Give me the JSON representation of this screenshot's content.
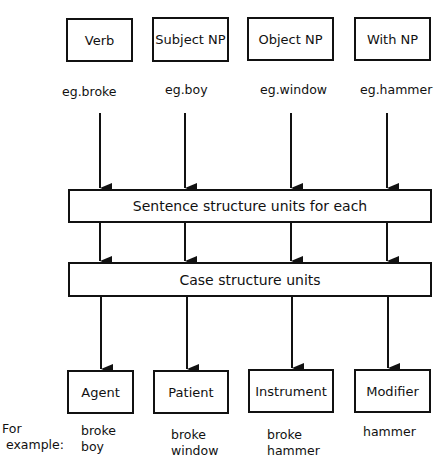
{
  "diagram": {
    "top_boxes": [
      {
        "label": "Verb",
        "example": "eg.broke"
      },
      {
        "label": "Subject NP",
        "example": "eg.boy"
      },
      {
        "label": "Object NP",
        "example": "eg.window"
      },
      {
        "label": "With NP",
        "example": "eg.hammer"
      }
    ],
    "middle_box_1": "Sentence structure units for each",
    "middle_box_2": "Case structure units",
    "bottom_boxes": [
      {
        "label": "Agent",
        "example": "broke\nboy"
      },
      {
        "label": "Patient",
        "example": "broke\nwindow"
      },
      {
        "label": "Instrument",
        "example": "broke\nhammer"
      },
      {
        "label": "Modifier",
        "example": "hammer"
      }
    ],
    "for_example_label": "For\n example:"
  }
}
